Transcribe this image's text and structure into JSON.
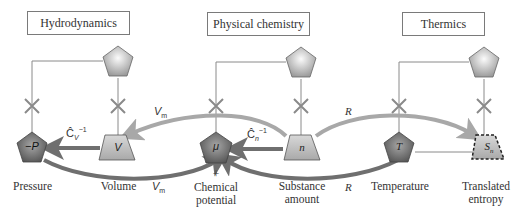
{
  "domains": [
    {
      "label": "Hydrodynamics"
    },
    {
      "label": "Physical chemistry"
    },
    {
      "label": "Thermics"
    }
  ],
  "nodes": {
    "pressure": {
      "symbol": "−P",
      "caption": "Pressure",
      "shape": "pentagon"
    },
    "volume": {
      "symbol": "V",
      "caption": "Volume",
      "shape": "trapezoid"
    },
    "chemical_potential": {
      "symbol": "μ",
      "caption_line1": "Chemical",
      "caption_line2": "potential",
      "plus": "+",
      "shape": "pentagon"
    },
    "substance_amount": {
      "symbol": "n",
      "caption_line1": "Substance",
      "caption_line2": "amount",
      "shape": "trapezoid"
    },
    "temperature": {
      "symbol": "T",
      "caption": "Temperature",
      "shape": "pentagon"
    },
    "translated_entropy": {
      "symbol": "S",
      "symbol_sub": "n",
      "caption_line1": "Translated",
      "caption_line2": "entropy",
      "shape": "trapezoid-dashed"
    }
  },
  "edge_labels": {
    "cv_inv": {
      "main": "Ĉ",
      "sub": "V",
      "sup": "−1"
    },
    "cn_inv": {
      "main": "Ĉ",
      "sub": "n",
      "sup": "−1"
    },
    "vm_top": {
      "main": "V",
      "sub": "m"
    },
    "vm_bottom": {
      "main": "V",
      "sub": "m"
    },
    "r_top": {
      "main": "R"
    },
    "r_bottom": {
      "main": "R"
    }
  },
  "colors": {
    "arrow_dark": "#6f6f6f",
    "arrow_light": "#a8a8a8",
    "pentagon_dark": "#7a7a7a",
    "trapezoid_fill": "#bdbdbd",
    "top_pentagon": "#cfcfcf",
    "line": "#8a8a8a"
  }
}
